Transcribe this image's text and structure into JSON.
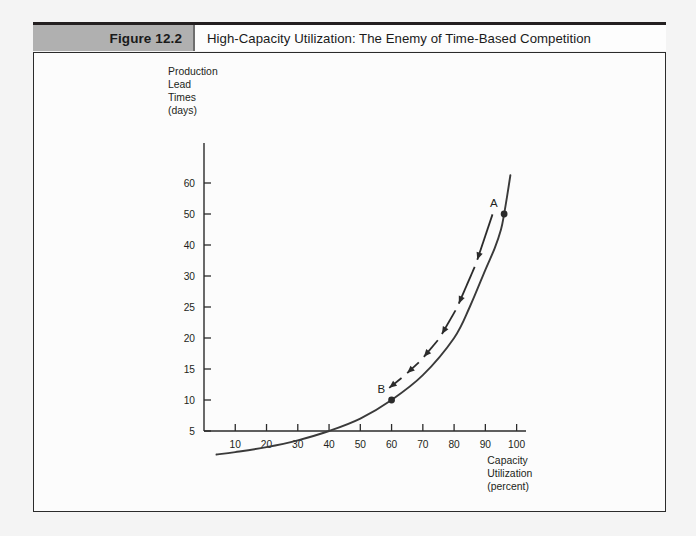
{
  "figure": {
    "number_label": "Figure 12.2",
    "title": "High-Capacity Utilization: The Enemy of Time-Based Competition"
  },
  "colors": {
    "header_gray": "#b0b0b0",
    "frame_border": "#2b2b2b",
    "curve": "#3a3a3a",
    "arrow": "#2b2b2b",
    "text": "#231f20",
    "panel_background": "#fcfcfc",
    "page_background": "#f4f4f4"
  },
  "chart_data": {
    "type": "line",
    "title": "High-Capacity Utilization: The Enemy of Time-Based Competition",
    "xlabel": "Capacity Utilization (percent)",
    "ylabel": "Production Lead Times (days)",
    "ylabel_lines": [
      "Production",
      "Lead",
      "Times",
      "(days)"
    ],
    "xlabel_lines": [
      "Capacity",
      "Utilization",
      "(percent)"
    ],
    "xlim": [
      0,
      103
    ],
    "ylim": [
      0,
      63
    ],
    "grid": false,
    "legend": null,
    "x_ticks": [
      10,
      20,
      30,
      40,
      50,
      60,
      70,
      80,
      90,
      100
    ],
    "x_tick_labels": [
      "10",
      "20",
      "30",
      "40",
      "50",
      "60",
      "70",
      "80",
      "90",
      "100"
    ],
    "y_ticks": [
      5,
      10,
      15,
      20,
      25,
      30,
      40,
      50,
      60
    ],
    "y_tick_labels": [
      "5",
      "10",
      "15",
      "20",
      "25",
      "30",
      "40",
      "50",
      "60"
    ],
    "series": [
      {
        "name": "Lead time vs capacity utilization curve",
        "x": [
          4,
          10,
          20,
          30,
          40,
          50,
          60,
          70,
          80,
          85,
          90,
          93,
          95,
          96,
          97,
          98
        ],
        "y": [
          1.2,
          1.6,
          2.4,
          3.5,
          5.0,
          7.0,
          10.0,
          14.0,
          20.0,
          25.0,
          32.0,
          39.0,
          45.0,
          50.0,
          56.0,
          62.5
        ]
      }
    ],
    "annotations": [
      {
        "label": "A",
        "x": 96,
        "y": 50,
        "marker": "filled-circle",
        "description": "High-capacity utilization operating point with long lead times"
      },
      {
        "label": "B",
        "x": 60,
        "y": 10,
        "marker": "filled-circle",
        "description": "Lower-capacity utilization operating point with short lead times"
      },
      {
        "label": "",
        "type": "arrow-chain",
        "from": "A",
        "to": "B",
        "segments": 6,
        "description": "Dashed chain of arrows showing movement from point A down to point B"
      }
    ]
  }
}
